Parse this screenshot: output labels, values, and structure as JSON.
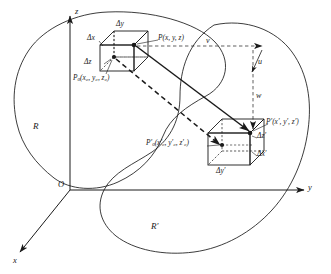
{
  "figure": {
    "axes": {
      "z_label": "z",
      "y_label": "y",
      "x_label": "x",
      "origin_label": "O"
    },
    "regions": [
      {
        "name": "source-region",
        "label": "R"
      },
      {
        "name": "image-region",
        "label": "R′"
      }
    ],
    "source_box": {
      "point_label": "P",
      "point_coords": "(x, y, z)",
      "base_point_label": "P",
      "base_point_sub": "0",
      "base_point_coords": "(x₀, y₀, z₀)",
      "edge_dx": "Δx",
      "edge_dy": "Δy",
      "edge_dz": "Δz"
    },
    "image_box": {
      "point_label": "P′",
      "point_coords": "(x′, y′, z′)",
      "base_point_label": "P′",
      "base_point_sub": "0",
      "base_point_coords": "(x′₀, y′₀, z′₀)",
      "edge_dx": "Δx′",
      "edge_dy": "Δy′",
      "edge_dz": "Δz′"
    },
    "vectors": [
      {
        "name": "vector-v",
        "label": "v"
      },
      {
        "name": "vector-u",
        "label": "u"
      },
      {
        "name": "vector-w",
        "label": "w"
      }
    ],
    "colors": {
      "line": "#1a1a1a",
      "background": "#ffffff"
    }
  }
}
